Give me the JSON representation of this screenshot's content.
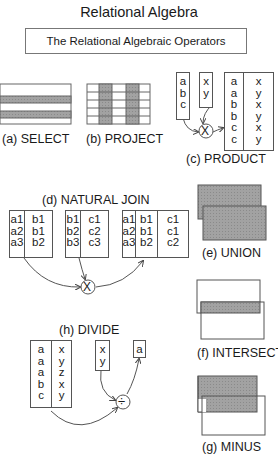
{
  "title": "Relational Algebra",
  "subtitle": "The Relational Algebraic Operators",
  "operators": {
    "select": {
      "caption": "(a) SELECT"
    },
    "project": {
      "caption": "(b) PROJECT"
    },
    "product": {
      "caption": "(c) PRODUCT",
      "input_a": [
        "a",
        "b",
        "c"
      ],
      "input_b": [
        "x",
        "y"
      ],
      "result_col1": [
        "a",
        "a",
        "b",
        "b",
        "c",
        "c"
      ],
      "result_col2": [
        "x",
        "y",
        "x",
        "y",
        "x",
        "y"
      ],
      "operator_symbol": "X"
    },
    "natural_join": {
      "caption": "(d) NATURAL JOIN",
      "table1": {
        "col1": [
          "a1",
          "a2",
          "a3"
        ],
        "col2": [
          "b1",
          "b1",
          "b2"
        ]
      },
      "table2": {
        "col1": [
          "b1",
          "b2",
          "b3"
        ],
        "col2": [
          "c1",
          "c2",
          "c3"
        ]
      },
      "result": {
        "col1": [
          "a1",
          "a2",
          "a3"
        ],
        "col2": [
          "b1",
          "b1",
          "b2"
        ],
        "col3": [
          "c1",
          "c1",
          "c2"
        ]
      },
      "operator_symbol": "X"
    },
    "union": {
      "caption": "(e) UNION"
    },
    "intersect": {
      "caption": "(f) INTERSECT"
    },
    "minus": {
      "caption": "(g) MINUS"
    },
    "divide": {
      "caption": "(h) DIVIDE",
      "dividend_col1": [
        "a",
        "a",
        "a",
        "b",
        "c"
      ],
      "dividend_col2": [
        "x",
        "y",
        "z",
        "x",
        "y"
      ],
      "divisor": [
        "x",
        "y"
      ],
      "result": [
        "a"
      ],
      "operator_symbol": "÷"
    }
  },
  "colors": {
    "shade": "#9a9a9a",
    "line": "#555555"
  }
}
